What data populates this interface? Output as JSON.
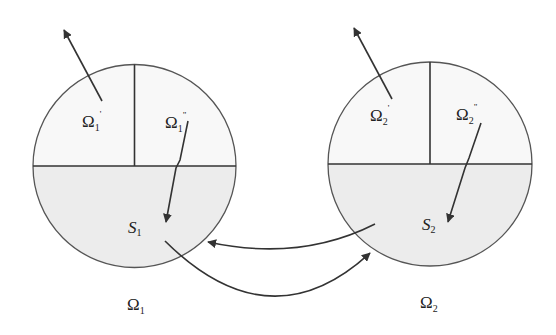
{
  "colors": {
    "stroke": "#3a3a3a",
    "lower_fill": "#ececec",
    "upper_fill": "#f8f8f8",
    "background": "#ffffff"
  },
  "domains": [
    {
      "id": "omega1",
      "name_base": "Ω",
      "name_sub": "1",
      "upper_left": {
        "base": "Ω",
        "sub": "1",
        "sup": "'"
      },
      "upper_right": {
        "base": "Ω",
        "sub": "1",
        "sup": "\""
      },
      "lower": {
        "base": "S",
        "sub": "1"
      }
    },
    {
      "id": "omega2",
      "name_base": "Ω",
      "name_sub": "2",
      "upper_left": {
        "base": "Ω",
        "sub": "2",
        "sup": "'"
      },
      "upper_right": {
        "base": "Ω",
        "sub": "2",
        "sup": "\""
      },
      "lower": {
        "base": "S",
        "sub": "2"
      }
    }
  ],
  "arrows": [
    {
      "from": "Ω1'",
      "to": "outside",
      "kind": "straight"
    },
    {
      "from": "Ω1\"",
      "to": "S1",
      "kind": "straight"
    },
    {
      "from": "Ω2'",
      "to": "outside",
      "kind": "straight"
    },
    {
      "from": "Ω2\"",
      "to": "S2",
      "kind": "straight"
    },
    {
      "from": "S1",
      "to": "Ω2",
      "kind": "curved"
    },
    {
      "from": "S2",
      "to": "Ω1",
      "kind": "curved"
    }
  ]
}
